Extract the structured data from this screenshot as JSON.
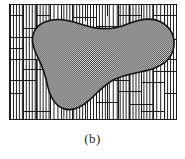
{
  "figure": {
    "caption": "(b)",
    "panel_label": "(b)",
    "frame": {
      "x": 9,
      "y": 4,
      "width": 168,
      "height": 116,
      "border_color": "#1b1b1b",
      "background_color": "#ffffff"
    },
    "background_pattern": {
      "name": "vertical-hatch",
      "line_color": "#1e1e1e",
      "line_width": 1,
      "spacing": 3,
      "description": "vertical line hatching filling each rectangular cell"
    },
    "region": {
      "name": "shaded-blob-region",
      "fill_pattern": "50-percent-checkerboard-dither",
      "fill_color": "#808080",
      "outline_color": "#111111",
      "outline_width": 1.6,
      "path": "M 150 16 C 160 20 167 29 166 41 C 165 53 156 61 144 65 C 131 69 117 70 105 76 C 95 81 88 90 80 97 C 72 104 62 109 53 105 C 44 101 40 91 38 82 C 36 72 33 63 29 55 C 24 45 20 35 25 26 C 30 17 42 14 53 15 C 64 16 74 21 85 23 C 96 25 107 24 117 20 C 127 16 140 12 150 16 Z"
    },
    "cells": {
      "name": "irregular-rectangular-cell-grid",
      "divider_color": "#1b1b1b",
      "divider_width": 1.1,
      "vertical_dividers": [
        14,
        27,
        41,
        52,
        63,
        76,
        88,
        99,
        110,
        121,
        133,
        145,
        156
      ],
      "horizontal_dividers": [
        11,
        22,
        33,
        44,
        55,
        66,
        77,
        88,
        99,
        108
      ]
    }
  },
  "colors": {
    "ink": "#1b1b1b",
    "paper": "#ffffff",
    "shade": "#808080"
  }
}
